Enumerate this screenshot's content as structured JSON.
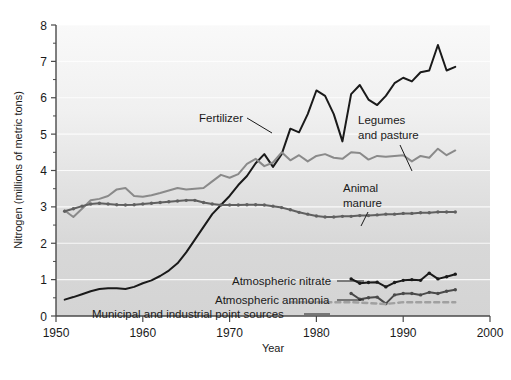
{
  "chart_data": {
    "type": "line",
    "title": "",
    "xlabel": "Year",
    "ylabel": "Nitrogen (millions of metric tons)",
    "xlim": [
      1950,
      2000
    ],
    "ylim": [
      0,
      8
    ],
    "xticks": [
      1950,
      1960,
      1970,
      1980,
      1990,
      2000
    ],
    "xtick_labels": [
      "1950",
      "1960",
      "1970",
      "1980",
      "1990",
      "2000"
    ],
    "yticks": [
      0,
      1,
      2,
      3,
      4,
      5,
      6,
      7,
      8
    ],
    "ytick_labels": [
      "0",
      "1",
      "2",
      "3",
      "4",
      "5",
      "6",
      "7",
      "8"
    ],
    "minor_yticks": [
      0.5,
      1.5,
      2.5,
      3.5,
      4.5,
      5.5,
      6.5,
      7.5
    ],
    "grid": "horizontal-major-white",
    "legend": "inline-annotations",
    "series": [
      {
        "name": "Fertilizer",
        "color": "#1a1a1a",
        "style": "solid",
        "marker": "none",
        "x": [
          1951,
          1952,
          1953,
          1954,
          1955,
          1956,
          1957,
          1958,
          1959,
          1960,
          1961,
          1962,
          1963,
          1964,
          1965,
          1966,
          1967,
          1968,
          1969,
          1970,
          1971,
          1972,
          1973,
          1974,
          1975,
          1976,
          1977,
          1978,
          1979,
          1980,
          1981,
          1982,
          1983,
          1984,
          1985,
          1986,
          1987,
          1988,
          1989,
          1990,
          1991,
          1992,
          1993,
          1994,
          1995,
          1996
        ],
        "values": [
          0.45,
          0.52,
          0.6,
          0.68,
          0.74,
          0.76,
          0.76,
          0.74,
          0.8,
          0.9,
          0.98,
          1.1,
          1.25,
          1.45,
          1.75,
          2.1,
          2.45,
          2.8,
          3.05,
          3.3,
          3.6,
          3.85,
          4.2,
          4.45,
          4.1,
          4.45,
          5.15,
          5.05,
          5.55,
          6.2,
          6.05,
          5.55,
          4.8,
          6.1,
          6.35,
          5.95,
          5.8,
          6.05,
          6.4,
          6.55,
          6.45,
          6.7,
          6.75,
          7.45,
          6.75,
          6.85
        ]
      },
      {
        "name": "Legumes and pasture",
        "color": "#8a8a8a",
        "style": "solid",
        "marker": "none",
        "x": [
          1951,
          1952,
          1953,
          1954,
          1955,
          1956,
          1957,
          1958,
          1959,
          1960,
          1961,
          1962,
          1963,
          1964,
          1965,
          1966,
          1967,
          1968,
          1969,
          1970,
          1971,
          1972,
          1973,
          1974,
          1975,
          1976,
          1977,
          1978,
          1979,
          1980,
          1981,
          1982,
          1983,
          1984,
          1985,
          1986,
          1987,
          1988,
          1989,
          1990,
          1991,
          1992,
          1993,
          1994,
          1995,
          1996
        ],
        "values": [
          2.9,
          2.72,
          2.95,
          3.18,
          3.22,
          3.3,
          3.48,
          3.52,
          3.3,
          3.28,
          3.32,
          3.38,
          3.45,
          3.52,
          3.48,
          3.5,
          3.52,
          3.7,
          3.88,
          3.8,
          3.9,
          4.18,
          4.32,
          4.12,
          4.22,
          4.5,
          4.28,
          4.42,
          4.25,
          4.4,
          4.45,
          4.35,
          4.32,
          4.5,
          4.48,
          4.3,
          4.4,
          4.38,
          4.4,
          4.42,
          4.25,
          4.4,
          4.35,
          4.6,
          4.42,
          4.55
        ]
      },
      {
        "name": "Animal manure",
        "color": "#606060",
        "style": "solid",
        "marker": "dot",
        "x": [
          1951,
          1952,
          1953,
          1954,
          1955,
          1956,
          1957,
          1958,
          1959,
          1960,
          1961,
          1962,
          1963,
          1964,
          1965,
          1966,
          1967,
          1968,
          1969,
          1970,
          1971,
          1972,
          1973,
          1974,
          1975,
          1976,
          1977,
          1978,
          1979,
          1980,
          1981,
          1982,
          1983,
          1984,
          1985,
          1986,
          1987,
          1988,
          1989,
          1990,
          1991,
          1992,
          1993,
          1994,
          1995,
          1996
        ],
        "values": [
          2.88,
          2.95,
          3.02,
          3.08,
          3.1,
          3.08,
          3.06,
          3.05,
          3.06,
          3.08,
          3.1,
          3.12,
          3.14,
          3.16,
          3.18,
          3.18,
          3.12,
          3.08,
          3.05,
          3.05,
          3.05,
          3.06,
          3.06,
          3.05,
          3.02,
          2.98,
          2.92,
          2.85,
          2.8,
          2.75,
          2.72,
          2.72,
          2.74,
          2.74,
          2.76,
          2.76,
          2.78,
          2.8,
          2.8,
          2.82,
          2.82,
          2.84,
          2.84,
          2.86,
          2.86,
          2.86
        ]
      },
      {
        "name": "Atmospheric nitrate",
        "color": "#1a1a1a",
        "style": "solid",
        "marker": "dot",
        "x": [
          1984,
          1985,
          1986,
          1987,
          1988,
          1989,
          1990,
          1991,
          1992,
          1993,
          1994,
          1995,
          1996
        ],
        "values": [
          1.02,
          0.9,
          0.92,
          0.93,
          0.8,
          0.92,
          0.98,
          1.0,
          0.98,
          1.18,
          1.02,
          1.08,
          1.15
        ]
      },
      {
        "name": "Atmospheric ammonia",
        "color": "#4a4a4a",
        "style": "solid",
        "marker": "dot",
        "x": [
          1984,
          1985,
          1986,
          1987,
          1988,
          1989,
          1990,
          1991,
          1992,
          1993,
          1994,
          1995,
          1996
        ],
        "values": [
          0.62,
          0.46,
          0.5,
          0.52,
          0.34,
          0.58,
          0.62,
          0.62,
          0.58,
          0.65,
          0.62,
          0.68,
          0.72
        ]
      },
      {
        "name": "Municipal and industrial point sources",
        "color": "#a0a0a0",
        "style": "dashed",
        "marker": "none",
        "x": [
          1977,
          1980,
          1984,
          1988,
          1990,
          1993,
          1996
        ],
        "values": [
          0.38,
          0.38,
          0.38,
          0.33,
          0.38,
          0.38,
          0.38
        ]
      }
    ],
    "annotations": [
      {
        "text": "Fertilizer",
        "x": 199,
        "y": 122,
        "anchor": "start",
        "leader": "M 247 118 L 272 133"
      },
      {
        "text": "Legumes",
        "x": 358,
        "y": 124,
        "anchor": "start",
        "leader": ""
      },
      {
        "text": "and pasture",
        "x": 358,
        "y": 139,
        "anchor": "start",
        "leader": "M 400 145 L 412 171"
      },
      {
        "text": "Animal",
        "x": 343,
        "y": 192,
        "anchor": "start",
        "leader": ""
      },
      {
        "text": "manure",
        "x": 343,
        "y": 207,
        "anchor": "start",
        "leader": "M 368 212 L 361 226"
      },
      {
        "text": "Atmospheric nitrate",
        "x": 232,
        "y": 285,
        "anchor": "start",
        "leader": "M 337 281 L 364 281"
      },
      {
        "text": "Atmospheric ammonia",
        "x": 215,
        "y": 304,
        "anchor": "start",
        "leader": "M 337 300 L 364 300"
      },
      {
        "text": "Municipal and industrial point sources",
        "x": 92,
        "y": 318,
        "anchor": "start",
        "leader": "M 304 314 L 330 314"
      }
    ]
  },
  "axes": {
    "x_axis_title": "Year",
    "y_axis_title": "Nitrogen (millions of metric tons)"
  },
  "colors": {
    "plot_background_top": "#f7f7f7",
    "plot_background_bottom": "#d6d6d6",
    "frame": "#4a4a4a",
    "gridline": "#ffffff",
    "text": "#1a1a1a"
  }
}
